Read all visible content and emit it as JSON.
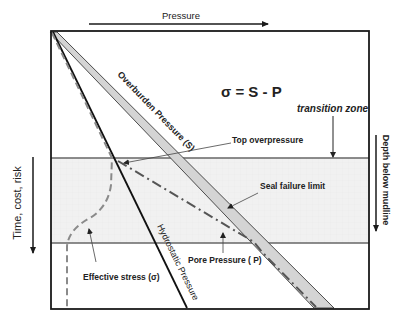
{
  "diagram": {
    "x_axis": {
      "label": "Pressure",
      "direction": "right"
    },
    "left_axis": {
      "label": "Time, cost, risk",
      "direction": "down"
    },
    "right_axis": {
      "label": "Depth below mudline",
      "direction": "down"
    },
    "equation": "σ = S - P",
    "zone": {
      "label": "transition zone"
    },
    "curves": {
      "overburden": "Overburden Pressure (S)",
      "hydrostatic": "Hydrostatic Pressure",
      "pore": "Pore Pressure ( P)",
      "effective": "Effective stress (σ)"
    },
    "annotations": {
      "top_overpressure": "Top overpressure",
      "seal_failure": "Seal failure limit"
    },
    "colors": {
      "frame": "#1a1a1a",
      "overburden_fill": "#d4d4d4",
      "zone_fill": "#f0f0f0",
      "zone_border": "#666666",
      "effective_stroke": "#8a8a8a",
      "pore_stroke": "#555555"
    }
  }
}
